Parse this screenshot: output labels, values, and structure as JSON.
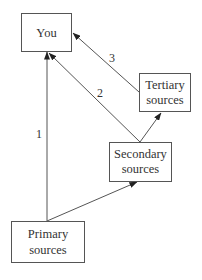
{
  "diagram": {
    "type": "flow",
    "colors": {
      "stroke": "#555555",
      "text": "#333333",
      "background": "#ffffff"
    },
    "nodes": {
      "you": {
        "label": "You",
        "lines": [
          "You"
        ]
      },
      "tertiary": {
        "label": "Tertiary sources",
        "lines": [
          "Tertiary",
          "sources"
        ]
      },
      "secondary": {
        "label": "Secondary sources",
        "lines": [
          "Secondary",
          "sources"
        ]
      },
      "primary": {
        "label": "Primary sources",
        "lines": [
          "Primary",
          "sources"
        ]
      }
    },
    "edges": [
      {
        "from": "primary",
        "to": "you",
        "label": "1"
      },
      {
        "from": "secondary",
        "to": "you",
        "label": "2"
      },
      {
        "from": "tertiary",
        "to": "you",
        "label": "3"
      },
      {
        "from": "primary",
        "to": "secondary",
        "label": ""
      },
      {
        "from": "secondary",
        "to": "tertiary",
        "label": ""
      }
    ]
  }
}
